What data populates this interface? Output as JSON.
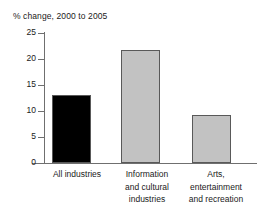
{
  "chart_data": {
    "type": "bar",
    "title": "% change, 2000 to 2005",
    "xlabel": "",
    "ylabel": "",
    "ylim": [
      0,
      25
    ],
    "yticks": [
      "0",
      "5",
      "10",
      "15",
      "20",
      "25"
    ],
    "grid": false,
    "legend": "none",
    "categories": [
      "All industries",
      "Information and cultural industries",
      "Arts, entertainment and recreation"
    ],
    "category_lines": [
      [
        "All industries"
      ],
      [
        "Information",
        "and cultural",
        "industries"
      ],
      [
        "Arts,",
        "entertainment",
        "and recreation"
      ]
    ],
    "values": [
      13.1,
      21.7,
      9.3
    ],
    "bar_colors": [
      "#000000",
      "#c2c2c2",
      "#c2c2c2"
    ],
    "bar_border_color": "#595959"
  }
}
